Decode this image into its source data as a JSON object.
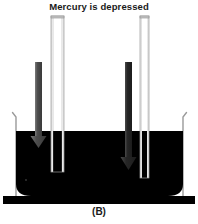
{
  "figure": {
    "title": "Mercury is depressed",
    "caption": "(B)",
    "alt_description": "Two glass capillary tubes standing in a reservoir of mercury; the mercury level inside each narrow tube is depressed below the reservoir surface, with downward arrows indicating the depression.",
    "colors": {
      "mercury": "#000000",
      "background": "#ffffff",
      "glass_outline": "#8a8a8a",
      "glass_fill": "#f2f2f2",
      "arrow": "#555555",
      "arrow_dark": "#2a2a2a",
      "base": "#000000",
      "text": "#1a1a1a"
    },
    "reservoir": {
      "label": "mercury-reservoir",
      "surface_y": 131,
      "left_wall_x": 16,
      "right_wall_x": 183,
      "bottom_y": 196
    },
    "base_stand": {
      "label": "base-stand",
      "top_y": 196,
      "height": 8
    },
    "tubes": [
      {
        "name": "wide-capillary-tube",
        "position": "left",
        "x": 51,
        "width": 13,
        "top_y": 16,
        "bottom_y": 172,
        "mercury_level_y": 149,
        "depression": "small"
      },
      {
        "name": "narrow-capillary-tube",
        "position": "right",
        "x": 140,
        "width": 9,
        "top_y": 16,
        "bottom_y": 178,
        "mercury_level_y": 168,
        "depression": "large"
      }
    ],
    "arrows": [
      {
        "name": "depression-arrow-left",
        "x": 35,
        "shaft_top_y": 62,
        "tip_y": 148,
        "shaft_width": 7,
        "direction": "down"
      },
      {
        "name": "depression-arrow-right",
        "x": 125,
        "shaft_top_y": 62,
        "tip_y": 170,
        "shaft_width": 7,
        "direction": "down"
      }
    ]
  }
}
